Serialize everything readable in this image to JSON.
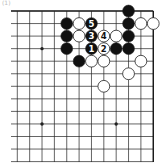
{
  "diagram": {
    "label": "(1)",
    "type": "go-board-corner",
    "corner": "top-right",
    "grid": {
      "columns": 12,
      "rows": 13,
      "x0": 17.3,
      "dx": 12.36,
      "y0": 11,
      "dy": 12.55,
      "line_left": 11,
      "line_bottom": 162,
      "right_edge": true,
      "top_edge": true
    },
    "hoshi": [
      {
        "c": 2,
        "r": 3
      },
      {
        "c": 2,
        "r": 9
      },
      {
        "c": 8,
        "r": 9
      }
    ],
    "stones": [
      {
        "color": "black",
        "c": 9,
        "r": 0
      },
      {
        "color": "black",
        "c": 4,
        "r": 1
      },
      {
        "color": "white",
        "c": 5,
        "r": 1
      },
      {
        "color": "black",
        "c": 6,
        "r": 1,
        "number": "5"
      },
      {
        "color": "black",
        "c": 9,
        "r": 1
      },
      {
        "color": "white",
        "c": 10,
        "r": 1
      },
      {
        "color": "white",
        "c": 11,
        "r": 1
      },
      {
        "color": "black",
        "c": 4,
        "r": 2
      },
      {
        "color": "white",
        "c": 5,
        "r": 2
      },
      {
        "color": "black",
        "c": 6,
        "r": 2,
        "number": "3"
      },
      {
        "color": "white",
        "c": 7,
        "r": 2,
        "number": "4"
      },
      {
        "color": "white",
        "c": 8,
        "r": 2
      },
      {
        "color": "black",
        "c": 9,
        "r": 2
      },
      {
        "color": "black",
        "c": 4,
        "r": 3
      },
      {
        "color": "black",
        "c": 6,
        "r": 3,
        "number": "1"
      },
      {
        "color": "white",
        "c": 7,
        "r": 3,
        "number": "2"
      },
      {
        "color": "black",
        "c": 8,
        "r": 3
      },
      {
        "color": "black",
        "c": 9,
        "r": 3
      },
      {
        "color": "black",
        "c": 5,
        "r": 4
      },
      {
        "color": "white",
        "c": 6,
        "r": 4
      },
      {
        "color": "white",
        "c": 7,
        "r": 4
      },
      {
        "color": "white",
        "c": 10,
        "r": 4
      },
      {
        "color": "white",
        "c": 9,
        "r": 5
      },
      {
        "color": "white",
        "c": 7,
        "r": 6
      }
    ],
    "colors": {
      "line": "#222222",
      "edge": "#111111",
      "black_stone": "#111111",
      "white_stone": "#ffffff",
      "stone_outline": "#222222"
    }
  }
}
